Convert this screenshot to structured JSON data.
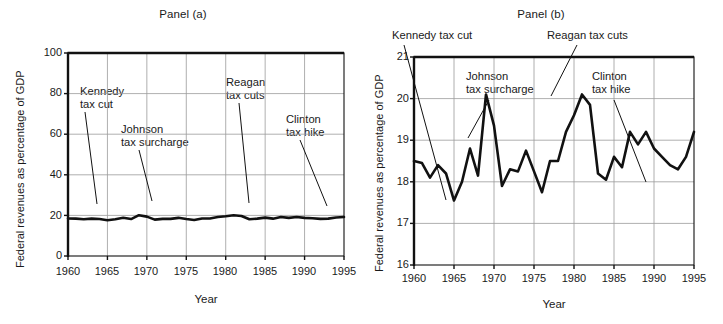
{
  "figure": {
    "background": "#ffffff",
    "line_color": "#111111",
    "grid_color": "#9a9a9a",
    "axis_color": "#111111"
  },
  "panels": [
    {
      "id": "a",
      "title": "Panel (a)",
      "xlabel": "Year",
      "ylabel": "Federal revenues as percentage of GDP",
      "yticks": [
        "100",
        "80",
        "60",
        "40",
        "20",
        "0"
      ],
      "xticks": [
        "1960",
        "1965",
        "1970",
        "1975",
        "1980",
        "1985",
        "1990",
        "1995"
      ],
      "annotations": [
        {
          "lines": [
            "Kennedy",
            "tax cut"
          ]
        },
        {
          "lines": [
            "Johnson",
            "tax surcharge"
          ]
        },
        {
          "lines": [
            "Reagan",
            "tax cuts"
          ]
        },
        {
          "lines": [
            "Clinton",
            "tax hike"
          ]
        }
      ]
    },
    {
      "id": "b",
      "title": "Panel (b)",
      "xlabel": "Year",
      "ylabel": "Federal revenues as percentage of GDP",
      "yticks": [
        "21",
        "20",
        "19",
        "18",
        "17",
        "16"
      ],
      "xticks": [
        "1960",
        "1965",
        "1970",
        "1975",
        "1980",
        "1985",
        "1990",
        "1995"
      ],
      "annotations": [
        {
          "lines": [
            "Kennedy tax cut"
          ]
        },
        {
          "lines": [
            "Johnson",
            "tax surcharge"
          ]
        },
        {
          "lines": [
            "Reagan tax cuts"
          ]
        },
        {
          "lines": [
            "Clinton",
            "tax hike"
          ]
        }
      ]
    }
  ],
  "chart_data": [
    {
      "type": "line",
      "panel": "a",
      "title": "Panel (a)",
      "xlabel": "Year",
      "ylabel": "Federal revenues as percentage of GDP",
      "xlim": [
        1960,
        1995
      ],
      "ylim": [
        0,
        100
      ],
      "xticks": [
        1960,
        1965,
        1970,
        1975,
        1980,
        1985,
        1990,
        1995
      ],
      "yticks": [
        0,
        20,
        40,
        60,
        80,
        100
      ],
      "grid": true,
      "legend": "none",
      "series": [
        {
          "name": "Federal revenues as percentage of GDP",
          "x": [
            1960,
            1961,
            1962,
            1963,
            1964,
            1965,
            1966,
            1967,
            1968,
            1969,
            1970,
            1971,
            1972,
            1973,
            1974,
            1975,
            1976,
            1977,
            1978,
            1979,
            1980,
            1981,
            1982,
            1983,
            1984,
            1985,
            1986,
            1987,
            1988,
            1989,
            1990,
            1991,
            1992,
            1993,
            1994,
            1995
          ],
          "values": [
            18.5,
            18.4,
            18.1,
            18.4,
            18.2,
            17.6,
            18.1,
            18.8,
            18.2,
            20.1,
            19.4,
            17.9,
            18.3,
            18.3,
            18.8,
            18.2,
            17.7,
            18.5,
            18.5,
            19.2,
            19.6,
            20.1,
            19.7,
            18.1,
            18.4,
            18.9,
            18.4,
            19.2,
            18.8,
            19.2,
            18.8,
            18.6,
            18.3,
            18.4,
            19.0,
            19.2
          ]
        }
      ],
      "annotations": [
        {
          "label": "Kennedy tax cut",
          "points_to_year": 1964
        },
        {
          "label": "Johnson tax surcharge",
          "points_to_year": 1969
        },
        {
          "label": "Reagan tax cuts",
          "points_to_year": 1981
        },
        {
          "label": "Clinton tax hike",
          "points_to_year": 1993
        }
      ]
    },
    {
      "type": "line",
      "panel": "b",
      "title": "Panel (b)",
      "xlabel": "Year",
      "ylabel": "Federal revenues as percentage of GDP",
      "xlim": [
        1960,
        1995
      ],
      "ylim": [
        16,
        21
      ],
      "xticks": [
        1960,
        1965,
        1970,
        1975,
        1980,
        1985,
        1990,
        1995
      ],
      "yticks": [
        16,
        17,
        18,
        19,
        20,
        21
      ],
      "grid": true,
      "legend": "none",
      "series": [
        {
          "name": "Federal revenues as percentage of GDP",
          "x": [
            1960,
            1961,
            1962,
            1963,
            1964,
            1965,
            1966,
            1967,
            1968,
            1969,
            1970,
            1971,
            1972,
            1973,
            1974,
            1975,
            1976,
            1977,
            1978,
            1979,
            1980,
            1981,
            1982,
            1983,
            1984,
            1985,
            1986,
            1987,
            1988,
            1989,
            1990,
            1991,
            1992,
            1993,
            1994,
            1995
          ],
          "values": [
            18.5,
            18.45,
            18.1,
            18.4,
            18.2,
            17.55,
            18.0,
            18.8,
            18.15,
            20.1,
            19.35,
            17.9,
            18.3,
            18.25,
            18.75,
            18.25,
            17.75,
            18.5,
            18.5,
            19.2,
            19.6,
            20.1,
            19.85,
            18.2,
            18.05,
            18.6,
            18.35,
            19.2,
            18.9,
            19.2,
            18.8,
            18.6,
            18.4,
            18.3,
            18.6,
            19.2
          ]
        }
      ],
      "annotations": [
        {
          "label": "Kennedy tax cut",
          "points_to_year": 1964
        },
        {
          "label": "Johnson tax surcharge",
          "points_to_year": 1969
        },
        {
          "label": "Reagan tax cuts",
          "points_to_year": 1981
        },
        {
          "label": "Clinton tax hike",
          "points_to_year": 1993
        }
      ]
    }
  ]
}
